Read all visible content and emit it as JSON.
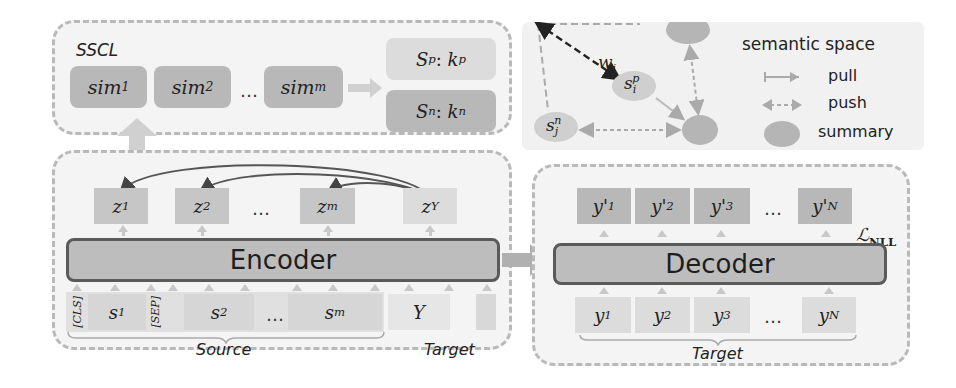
{
  "sscl": {
    "title": "SSCL",
    "sims": [
      {
        "base": "sim",
        "sub": "1"
      },
      {
        "base": "sim",
        "sub": "2"
      },
      {
        "base": "sim",
        "sub": "m"
      }
    ],
    "ellipsis": "…",
    "sets": [
      {
        "S": "S",
        "sup": "p",
        "k": "k",
        "ksup": "p"
      },
      {
        "S": "S",
        "sup": "n",
        "k": "k",
        "ksup": "n"
      }
    ]
  },
  "semantic_space": {
    "title": "semantic space",
    "weight_label": {
      "base": "w",
      "sub": "i"
    },
    "positive_node": {
      "base": "s",
      "sub": "i",
      "sup": "p"
    },
    "negative_node": {
      "base": "s",
      "sub": "j",
      "sup": "n"
    },
    "legend": [
      {
        "icon": "pull-arrow-icon",
        "label": "pull"
      },
      {
        "icon": "push-arrow-icon",
        "label": "push"
      },
      {
        "icon": "summary-ellipse-icon",
        "label": "summary"
      }
    ]
  },
  "encoder": {
    "label": "Encoder",
    "outputs": [
      {
        "base": "z",
        "sub": "1"
      },
      {
        "base": "z",
        "sub": "2"
      },
      {
        "base": "z",
        "sub": "m"
      },
      {
        "base": "z",
        "sub": "Y"
      }
    ],
    "inputs": {
      "cls": "[CLS]",
      "sep": "[SEP]",
      "sentences": [
        {
          "base": "s",
          "sub": "1"
        },
        {
          "base": "s",
          "sub": "2"
        },
        {
          "base": "s",
          "sub": "m"
        }
      ],
      "target": "Y"
    },
    "ellipsis": "…",
    "source_label": "Source",
    "target_label": "Target"
  },
  "decoder": {
    "label": "Decoder",
    "loss": {
      "base": "ℒ",
      "sub": "NLL"
    },
    "outputs": [
      {
        "base": "y'",
        "sub": "1"
      },
      {
        "base": "y'",
        "sub": "2"
      },
      {
        "base": "y'",
        "sub": "3"
      },
      {
        "base": "y'",
        "sub": "N"
      }
    ],
    "inputs": [
      {
        "base": "y",
        "sub": "1"
      },
      {
        "base": "y",
        "sub": "2"
      },
      {
        "base": "y",
        "sub": "3"
      },
      {
        "base": "y",
        "sub": "N"
      }
    ],
    "ellipsis": "…",
    "target_label": "Target"
  },
  "colors": {
    "panel_bg": "#f4f4f4",
    "panel_border": "#b9b9b9",
    "box_dark": "#b8b8b8",
    "box_light": "#dcdcdc",
    "coder_fill": "#bdbdbd",
    "coder_border": "#5a5a5a"
  }
}
